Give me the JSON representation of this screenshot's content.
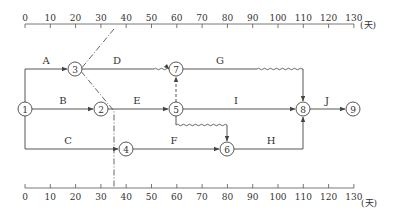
{
  "diagram": {
    "type": "time-scaled network diagram",
    "time_unit": "(天)",
    "axis_ticks": [
      "0",
      "10",
      "20",
      "30",
      "40",
      "50",
      "60",
      "70",
      "80",
      "90",
      "100",
      "110",
      "120",
      "130"
    ],
    "nodes": [
      {
        "id": "1",
        "label": "1",
        "time": 0
      },
      {
        "id": "2",
        "label": "2",
        "time": 30
      },
      {
        "id": "3",
        "label": "3",
        "time": 20
      },
      {
        "id": "4",
        "label": "4",
        "time": 40
      },
      {
        "id": "5",
        "label": "5",
        "time": 60
      },
      {
        "id": "6",
        "label": "6",
        "time": 80
      },
      {
        "id": "7",
        "label": "7",
        "time": 60
      },
      {
        "id": "8",
        "label": "8",
        "time": 110
      },
      {
        "id": "9",
        "label": "9",
        "time": 130
      }
    ],
    "activities": [
      {
        "label": "A",
        "from": "1",
        "to": "3"
      },
      {
        "label": "B",
        "from": "1",
        "to": "2"
      },
      {
        "label": "C",
        "from": "1",
        "to": "4"
      },
      {
        "label": "D",
        "from": "3",
        "to": "7"
      },
      {
        "label": "E",
        "from": "2",
        "to": "5"
      },
      {
        "label": "F",
        "from": "4",
        "to": "6"
      },
      {
        "label": "G",
        "from": "7",
        "to": "8"
      },
      {
        "label": "I",
        "from": "5",
        "to": "8"
      },
      {
        "label": "H",
        "from": "6",
        "to": "8"
      },
      {
        "label": "J",
        "from": "8",
        "to": "9"
      }
    ],
    "dummy_activities": [
      {
        "from": "5",
        "to": "7"
      },
      {
        "from": "5",
        "to": "6"
      }
    ],
    "check_line_time": 35
  }
}
